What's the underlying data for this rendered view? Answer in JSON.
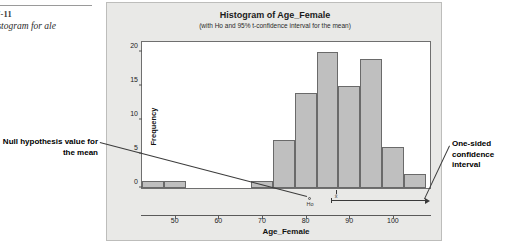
{
  "caption": {
    "figure_number": "7-11",
    "description": "histogram for\nale"
  },
  "annotations": {
    "left": "Null hypothesis\nvalue for the mean",
    "right": "One-sided\nconfidence\ninterval"
  },
  "chart_data": {
    "type": "bar",
    "title": "Histogram of Age_Female",
    "subtitle": "(with Ho and 95% t-confidence interval for the mean)",
    "xlabel": "Age_Female",
    "ylabel": "Frequency",
    "xlim": [
      42.5,
      108.5
    ],
    "ylim": [
      0,
      21.5
    ],
    "xticks": [
      50,
      60,
      70,
      80,
      90,
      100
    ],
    "yticks": [
      0,
      5,
      10,
      15,
      20
    ],
    "grid": false,
    "bin_width": 5,
    "bin_starts": [
      42.5,
      47.5,
      52.5,
      57.5,
      62.5,
      67.5,
      72.5,
      77.5,
      82.5,
      87.5,
      92.5,
      97.5,
      102.5
    ],
    "bin_centers": [
      45,
      50,
      55,
      60,
      65,
      70,
      75,
      80,
      85,
      90,
      95,
      100,
      105
    ],
    "values": [
      1,
      1,
      0,
      0,
      0,
      1,
      7,
      14,
      20,
      15,
      19,
      6,
      2
    ],
    "markers": {
      "ho_label": "Ho",
      "ho_value": 81,
      "xbar_label": "x̄",
      "xbar_value": 87,
      "ci_lower": 85.8,
      "ci_upper": 108.5,
      "ci_type": "one-sided"
    },
    "colors": {
      "bar_fill": "#bfbfbf",
      "bar_edge": "#6a6a6a",
      "panel_bg": "#e9e9e7",
      "plot_bg": "#ffffff"
    }
  }
}
